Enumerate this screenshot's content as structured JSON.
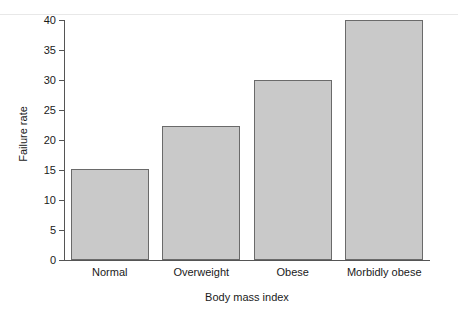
{
  "figure": {
    "background_color": "#ffffff",
    "bar_fill_color": "#c9c9c9",
    "bar_edge_color": "#6a6a6a",
    "axis_color": "#555555",
    "text_color": "#1a1a1a"
  },
  "chart_data": {
    "type": "bar",
    "title": "",
    "xlabel": "Body mass index",
    "ylabel": "Failure rate",
    "categories": [
      "Normal",
      "Overweight",
      "Obese",
      "Morbidly obese"
    ],
    "values": [
      15.2,
      22.3,
      30.0,
      40.0
    ],
    "ylim": [
      0,
      40
    ],
    "yticks": [
      0,
      5,
      10,
      15,
      20,
      25,
      30,
      35,
      40
    ],
    "ytick_labels": [
      "0",
      "5",
      "10",
      "15",
      "20",
      "25",
      "30",
      "35",
      "40"
    ],
    "grid": false,
    "legend": null,
    "series": [
      {
        "name": "Failure rate",
        "values": [
          15.2,
          22.3,
          30.0,
          40.0
        ]
      }
    ]
  }
}
